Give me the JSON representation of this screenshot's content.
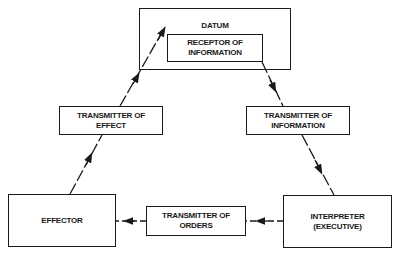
{
  "diagram": {
    "nodes": {
      "datum": "DATUM",
      "receptor": "RECEPTOR OF\nINFORMATION",
      "transmitter_effect": "TRANSMITTER OF\nEFFECT",
      "transmitter_information": "TRANSMITTER OF\nINFORMATION",
      "effector": "EFFECTOR",
      "transmitter_orders": "TRANSMITTER OF\nORDERS",
      "interpreter": "INTERPRETER\n(EXECUTIVE)"
    },
    "edges": [
      {
        "from": "receptor",
        "to": "transmitter_information",
        "style": "dashed-arrow"
      },
      {
        "from": "transmitter_information",
        "to": "interpreter",
        "style": "dashed-arrow"
      },
      {
        "from": "interpreter",
        "to": "transmitter_orders",
        "style": "dashed-arrow"
      },
      {
        "from": "transmitter_orders",
        "to": "effector",
        "style": "dashed-arrow"
      },
      {
        "from": "effector",
        "to": "transmitter_effect",
        "style": "dashed-arrow"
      },
      {
        "from": "transmitter_effect",
        "to": "datum",
        "style": "dashed-arrow"
      }
    ],
    "colors": {
      "stroke": "#1a1a1a",
      "background": "#ffffff"
    }
  }
}
